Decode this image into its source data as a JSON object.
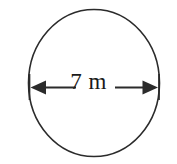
{
  "figure": {
    "kind": "circle-diameter-diagram",
    "background_color": "#ffffff",
    "stroke_color": "#2b2b2b",
    "text_color": "#1a1a1a",
    "shape": {
      "name": "circle",
      "center_x": 94,
      "center_y": 83,
      "radius_x": 66,
      "radius_y": 74
    },
    "dimension": {
      "label": "7 m",
      "value": 7,
      "unit": "m",
      "measures": "diameter",
      "line_y": 87,
      "line_start_x": 29,
      "line_end_x": 159,
      "left_arrow_icon": "arrow-left-icon",
      "right_arrow_icon": "arrow-right-icon",
      "left_tick_icon": "extension-tick-icon",
      "right_tick_icon": "extension-tick-icon"
    }
  }
}
